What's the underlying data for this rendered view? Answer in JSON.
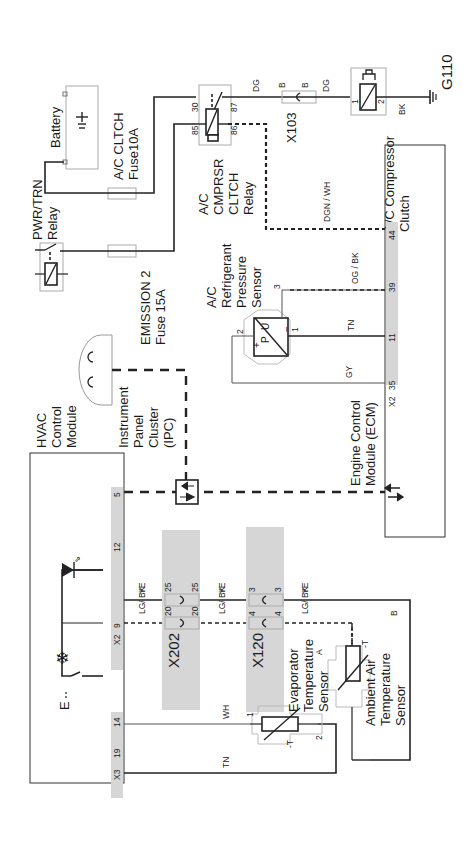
{
  "components": {
    "battery": "Battery",
    "ac_clutch_fuse": [
      "A/C CLTCH",
      "Fuse10A"
    ],
    "pwr_trn_relay": [
      "PWR/TRN",
      "Relay"
    ],
    "emission_fuse": [
      "EMISSION 2",
      "Fuse 15A"
    ],
    "ac_relay": [
      "A/C",
      "CMPRSR",
      "CLTCH",
      "Relay"
    ],
    "ac_clutch": [
      "A/C Compressor",
      "Clutch"
    ],
    "ground": "G110",
    "x103": "X103",
    "ac_pressure_sensor": [
      "A/C",
      "Refrigerant",
      "Pressure",
      "Sensor"
    ],
    "ecm": [
      "Engine Control",
      "Module (ECM)"
    ],
    "ipc": [
      "Instrument",
      "Panel",
      "Cluster",
      "(IPC)"
    ],
    "hvac": [
      "HVAC",
      "Control",
      "Module"
    ],
    "x202": "X202",
    "x120": "X120",
    "evap_sensor": [
      "Evaporator",
      "Temperature",
      "Sensor"
    ],
    "ambient_sensor": [
      "Ambient Air",
      "Temperature",
      "Sensor"
    ]
  },
  "pins": {
    "relay_30": "30",
    "relay_85": "85",
    "relay_86": "86",
    "relay_87": "87",
    "x103_b1": "B",
    "x103_b2": "B",
    "clutch_1": "1",
    "clutch_2": "2",
    "ecm_44": "44",
    "ecm_39": "39",
    "ecm_11": "11",
    "ecm_35": "35",
    "ecm_x2": "X2",
    "sensor_1": "1",
    "sensor_2": "2",
    "sensor_3": "3",
    "sensor_p": "P",
    "sensor_u": "U",
    "sensor_plus": "+",
    "sensor_minus": "−",
    "hvac_5": "5",
    "hvac_12": "12",
    "hvac_9": "9",
    "hvac_x2": "X2",
    "hvac_14": "14",
    "hvac_19": "19",
    "hvac_x3": "X3",
    "x202_25a": "25",
    "x202_25b": "25",
    "x202_20a": "20",
    "x202_20b": "20",
    "x120_3a": "3",
    "x120_3b": "3",
    "x120_4a": "4",
    "x120_4b": "4",
    "evap_1": "1",
    "evap_2": "2",
    "evap_t": "-T",
    "amb_a": "A",
    "amb_b": "B",
    "amb_t": "-T"
  },
  "wires": {
    "dg_1": "DG",
    "dg_2": "DG",
    "bk": "BK",
    "dgn_wh": "DGN / WH",
    "og_bk": "OG / BK",
    "tn_1": "TN",
    "gy": "GY",
    "ye_1": "YE",
    "ye_2": "YE",
    "ye_3": "YE",
    "lgbk_1": "LG/ BK",
    "lgbk_2": "LG/ BK",
    "lgbk_3": "LG/ BK",
    "wh": "WH",
    "tn_2": "TN"
  },
  "symbols": {
    "snowflake": "❄",
    "e_switch": "E"
  }
}
